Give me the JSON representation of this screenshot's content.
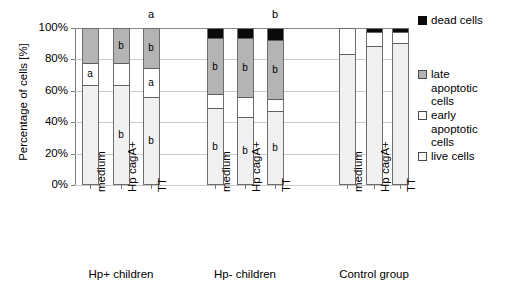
{
  "chart_data": {
    "type": "bar",
    "subtype": "stacked-percent-column",
    "title": "",
    "xlabel": "",
    "ylabel": "Percentage of cells [%]",
    "ylim": [
      0,
      100
    ],
    "yticks": [
      "0%",
      "20%",
      "40%",
      "60%",
      "80%",
      "100%"
    ],
    "ytick_values": [
      0,
      20,
      40,
      60,
      80,
      100
    ],
    "grid": true,
    "legend_position": "right",
    "legend": [
      "dead cells",
      "late apoptotic cells",
      "early apoptotic cells",
      "live cells"
    ],
    "series": [
      {
        "name": "live cells",
        "values": [
          64,
          64,
          56,
          49,
          43,
          47,
          84,
          89,
          91
        ]
      },
      {
        "name": "early apoptotic cells",
        "values": [
          14,
          14,
          19,
          9,
          13,
          8,
          16,
          9,
          7
        ]
      },
      {
        "name": "late apoptotic cells",
        "values": [
          22,
          22,
          25,
          36,
          38,
          38,
          0,
          0,
          0
        ]
      },
      {
        "name": "dead cells",
        "values": [
          0,
          0,
          0,
          6,
          6,
          7,
          0,
          2,
          2
        ]
      }
    ],
    "categories": [
      "medium",
      "Hp cagA+",
      "TT",
      "medium",
      "Hp cagA+",
      "TT",
      "medium",
      "Hp cagA+",
      "TT"
    ],
    "groups": [
      {
        "label": "Hp+ children",
        "categories": [
          "medium",
          "Hp cagA+",
          "TT"
        ]
      },
      {
        "label": "Hp- children",
        "categories": [
          "medium",
          "Hp cagA+",
          "TT"
        ]
      },
      {
        "label": "Control group",
        "categories": [
          "medium",
          "Hp cagA+",
          "TT"
        ]
      }
    ],
    "annotations": {
      "above_bars": [
        "",
        "",
        "a",
        "",
        "",
        "b",
        "",
        "",
        ""
      ],
      "in_segment": [
        {
          "bar": 0,
          "segment": "early apoptotic cells",
          "text": "a"
        },
        {
          "bar": 1,
          "segment": "late apoptotic cells",
          "text": "b"
        },
        {
          "bar": 1,
          "segment": "live cells",
          "text": "b"
        },
        {
          "bar": 2,
          "segment": "late apoptotic cells",
          "text": "b"
        },
        {
          "bar": 2,
          "segment": "early apoptotic cells",
          "text": "a"
        },
        {
          "bar": 2,
          "segment": "live cells",
          "text": "b"
        },
        {
          "bar": 3,
          "segment": "late apoptotic cells",
          "text": "b"
        },
        {
          "bar": 3,
          "segment": "live cells",
          "text": "b"
        },
        {
          "bar": 4,
          "segment": "late apoptotic cells",
          "text": "b"
        },
        {
          "bar": 4,
          "segment": "live cells",
          "text": "b"
        },
        {
          "bar": 5,
          "segment": "late apoptotic cells",
          "text": "b"
        },
        {
          "bar": 5,
          "segment": "live cells",
          "text": "b"
        }
      ]
    },
    "colors": {
      "dead cells": "#0a0a0a",
      "late apoptotic cells": "#b4b4b4",
      "early apoptotic cells": "#ffffff",
      "live cells": "#f1f1f1",
      "gridline": "#c9c9c9",
      "axis": "#7a7a7a",
      "bar_outline": "#6d6d6d"
    }
  },
  "axis": {
    "y_title": "Percentage of cells [%]",
    "y_ticks": [
      {
        "label": "100%"
      },
      {
        "label": "80%"
      },
      {
        "label": "60%"
      },
      {
        "label": "40%"
      },
      {
        "label": "20%"
      },
      {
        "label": "0%"
      }
    ]
  },
  "bars": [
    {
      "tick_label": "medium",
      "top_annotation": "",
      "segments": [
        {
          "kind": "late",
          "label": "",
          "pct": 22
        },
        {
          "kind": "early",
          "label": "a",
          "pct": 14
        },
        {
          "kind": "live",
          "label": "",
          "pct": 64
        }
      ]
    },
    {
      "tick_label": "Hp cagA+",
      "top_annotation": "",
      "segments": [
        {
          "kind": "late",
          "label": "b",
          "pct": 22
        },
        {
          "kind": "early",
          "label": "",
          "pct": 14
        },
        {
          "kind": "live",
          "label": "b",
          "pct": 64
        }
      ]
    },
    {
      "tick_label": "TT",
      "top_annotation": "a",
      "segments": [
        {
          "kind": "late",
          "label": "b",
          "pct": 25
        },
        {
          "kind": "early",
          "label": "a",
          "pct": 19
        },
        {
          "kind": "live",
          "label": "b",
          "pct": 56
        }
      ]
    },
    {
      "tick_label": "medium",
      "top_annotation": "",
      "segments": [
        {
          "kind": "dead",
          "label": "",
          "pct": 6
        },
        {
          "kind": "late",
          "label": "b",
          "pct": 36
        },
        {
          "kind": "early",
          "label": "",
          "pct": 9
        },
        {
          "kind": "live",
          "label": "b",
          "pct": 49
        }
      ]
    },
    {
      "tick_label": "Hp cagA+",
      "top_annotation": "",
      "segments": [
        {
          "kind": "dead",
          "label": "",
          "pct": 6
        },
        {
          "kind": "late",
          "label": "b",
          "pct": 38
        },
        {
          "kind": "early",
          "label": "",
          "pct": 13
        },
        {
          "kind": "live",
          "label": "b",
          "pct": 43
        }
      ]
    },
    {
      "tick_label": "TT",
      "top_annotation": "b",
      "segments": [
        {
          "kind": "dead",
          "label": "",
          "pct": 7
        },
        {
          "kind": "late",
          "label": "b",
          "pct": 38
        },
        {
          "kind": "early",
          "label": "",
          "pct": 8
        },
        {
          "kind": "live",
          "label": "b",
          "pct": 47
        }
      ]
    },
    {
      "tick_label": "medium",
      "top_annotation": "",
      "segments": [
        {
          "kind": "early",
          "label": "",
          "pct": 16
        },
        {
          "kind": "live",
          "label": "",
          "pct": 84
        }
      ]
    },
    {
      "tick_label": "Hp cagA+",
      "top_annotation": "",
      "segments": [
        {
          "kind": "dead",
          "label": "",
          "pct": 2
        },
        {
          "kind": "early",
          "label": "",
          "pct": 9
        },
        {
          "kind": "live",
          "label": "",
          "pct": 89
        }
      ]
    },
    {
      "tick_label": "TT",
      "top_annotation": "",
      "segments": [
        {
          "kind": "dead",
          "label": "",
          "pct": 2
        },
        {
          "kind": "early",
          "label": "",
          "pct": 7
        },
        {
          "kind": "live",
          "label": "",
          "pct": 91
        }
      ]
    }
  ],
  "groups": [
    {
      "label": "Hp+ children"
    },
    {
      "label": "Hp- children"
    },
    {
      "label": "Control group"
    }
  ],
  "legend": [
    {
      "kind": "dead",
      "lines": [
        "dead cells"
      ]
    },
    {
      "kind": "late",
      "lines": [
        "late",
        "apoptotic",
        "cells"
      ]
    },
    {
      "kind": "early",
      "lines": [
        "early",
        "apoptotic",
        "cells"
      ]
    },
    {
      "kind": "live",
      "lines": [
        "live cells"
      ]
    }
  ]
}
